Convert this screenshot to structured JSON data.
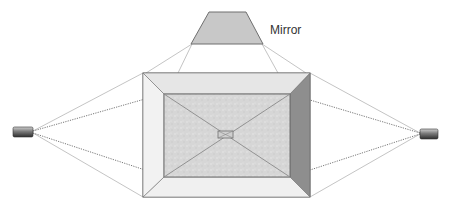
{
  "diagram": {
    "title": "",
    "labels": {
      "mirror": "Mirror"
    },
    "components": [
      {
        "id": "mirror",
        "shape": "trapezoid",
        "label": "Mirror"
      },
      {
        "id": "box",
        "shape": "beveled-rectangle"
      },
      {
        "id": "center-target",
        "shape": "small-rectangle"
      },
      {
        "id": "camera-left",
        "shape": "cylinder"
      },
      {
        "id": "camera-right",
        "shape": "cylinder"
      }
    ],
    "colors": {
      "outline": "#6f6f6f",
      "mirror_fill": "#c8c8c8",
      "bevel_fill": "#ececec",
      "inner_fill": "#d9d9d9",
      "right_side_fill": "#8e8e8e",
      "ray_solid": "#b5b5b5",
      "ray_dotted": "#555555"
    }
  }
}
